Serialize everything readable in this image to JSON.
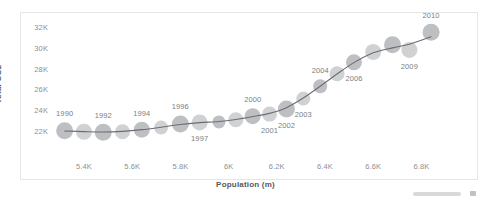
{
  "chart_data": {
    "type": "scatter",
    "title": "",
    "xlabel": "Population (m)",
    "ylabel": "Total CO2",
    "xlim": [
      5280,
      6960
    ],
    "ylim": [
      21200,
      32600
    ],
    "grid": false,
    "legend": "none",
    "x_ticks": [
      "5.4K",
      "5.6K",
      "5.8K",
      "6K",
      "6.2K",
      "6.4K",
      "6.6K",
      "6.8K"
    ],
    "y_ticks": [
      "32K",
      "30K",
      "28K",
      "26K",
      "24K",
      "22K"
    ],
    "series": [
      {
        "name": "Total CO2 vs Population",
        "point_label_key": "year",
        "points": [
          {
            "year": "1990",
            "x": 5320,
            "y": 22100,
            "size": 17,
            "label_shown": true,
            "label_pos": "above"
          },
          {
            "year": "1991",
            "x": 5400,
            "y": 22000,
            "size": 16,
            "label_shown": false,
            "label_pos": "above"
          },
          {
            "year": "1992",
            "x": 5480,
            "y": 21950,
            "size": 17,
            "label_shown": true,
            "label_pos": "above"
          },
          {
            "year": "1993",
            "x": 5560,
            "y": 22000,
            "size": 15,
            "label_shown": false,
            "label_pos": "above"
          },
          {
            "year": "1994",
            "x": 5640,
            "y": 22200,
            "size": 16,
            "label_shown": true,
            "label_pos": "above"
          },
          {
            "year": "1995",
            "x": 5720,
            "y": 22400,
            "size": 14,
            "label_shown": false,
            "label_pos": "above"
          },
          {
            "year": "1996",
            "x": 5800,
            "y": 22750,
            "size": 17,
            "label_shown": true,
            "label_pos": "above"
          },
          {
            "year": "1997",
            "x": 5880,
            "y": 22900,
            "size": 16,
            "label_shown": true,
            "label_pos": "below"
          },
          {
            "year": "1998",
            "x": 5960,
            "y": 22950,
            "size": 13,
            "label_shown": false,
            "label_pos": "above"
          },
          {
            "year": "1999",
            "x": 6030,
            "y": 23150,
            "size": 15,
            "label_shown": false,
            "label_pos": "above"
          },
          {
            "year": "2000",
            "x": 6100,
            "y": 23500,
            "size": 16,
            "label_shown": true,
            "label_pos": "above"
          },
          {
            "year": "2001",
            "x": 6170,
            "y": 23700,
            "size": 15,
            "label_shown": true,
            "label_pos": "below"
          },
          {
            "year": "2002",
            "x": 6240,
            "y": 24200,
            "size": 17,
            "label_shown": true,
            "label_pos": "below"
          },
          {
            "year": "2003",
            "x": 6310,
            "y": 25200,
            "size": 14,
            "label_shown": true,
            "label_pos": "below"
          },
          {
            "year": "2004",
            "x": 6380,
            "y": 26400,
            "size": 14,
            "label_shown": true,
            "label_pos": "above"
          },
          {
            "year": "2005",
            "x": 6450,
            "y": 27600,
            "size": 15,
            "label_shown": false,
            "label_pos": "above"
          },
          {
            "year": "2006",
            "x": 6520,
            "y": 28700,
            "size": 16,
            "label_shown": true,
            "label_pos": "below"
          },
          {
            "year": "2007",
            "x": 6600,
            "y": 29700,
            "size": 16,
            "label_shown": false,
            "label_pos": "above"
          },
          {
            "year": "2008",
            "x": 6680,
            "y": 30400,
            "size": 17,
            "label_shown": false,
            "label_pos": "above"
          },
          {
            "year": "2009",
            "x": 6750,
            "y": 29900,
            "size": 16,
            "label_shown": true,
            "label_pos": "below"
          },
          {
            "year": "2010",
            "x": 6840,
            "y": 31600,
            "size": 17,
            "label_shown": true,
            "label_pos": "above"
          }
        ]
      }
    ],
    "trendline": {
      "shown": true,
      "color": "#6b6d71",
      "width": 1.1
    },
    "colors": {
      "bubble_fill": "#c9cbcd",
      "bubble_fill_dark": "#b4b6b9",
      "axis_text": "#8d8f93",
      "axis_title": "#56585c",
      "point_label": "#7c7e82",
      "panel_border": "#e4e6e8",
      "background": "#ffffff",
      "scrollbar_thumb": "#d7d9db"
    }
  },
  "scrollbar": {
    "name": "horizontal-scrollbar",
    "visible": true
  }
}
